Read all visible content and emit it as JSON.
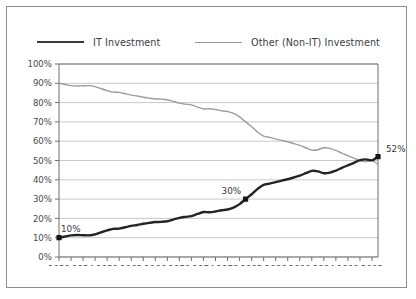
{
  "chart_data": {
    "type": "line",
    "title": "",
    "xlabel": "",
    "ylabel": "",
    "xlim": [
      1950,
      2003
    ],
    "ylim": [
      0,
      100
    ],
    "grid": true,
    "legend_position": "top",
    "y_ticks": [
      "0%",
      "10%",
      "20%",
      "30%",
      "40%",
      "50%",
      "60%",
      "70%",
      "80%",
      "90%",
      "100%"
    ],
    "y_tick_values": [
      0,
      10,
      20,
      30,
      40,
      50,
      60,
      70,
      80,
      90,
      100
    ],
    "x_ticks": [
      "1950",
      "1954",
      "1958",
      "1962",
      "1966",
      "1970",
      "1974",
      "1978",
      "1982",
      "1986",
      "1990",
      "1994",
      "1998",
      "2002"
    ],
    "x_tick_values": [
      1950,
      1954,
      1958,
      1962,
      1966,
      1970,
      1974,
      1978,
      1982,
      1986,
      1990,
      1994,
      1998,
      2002
    ],
    "x": [
      1950,
      1951,
      1952,
      1953,
      1954,
      1955,
      1956,
      1957,
      1958,
      1959,
      1960,
      1961,
      1962,
      1963,
      1964,
      1965,
      1966,
      1967,
      1968,
      1969,
      1970,
      1971,
      1972,
      1973,
      1974,
      1975,
      1976,
      1977,
      1978,
      1979,
      1980,
      1981,
      1982,
      1983,
      1984,
      1985,
      1986,
      1987,
      1988,
      1989,
      1990,
      1991,
      1992,
      1993,
      1994,
      1995,
      1996,
      1997,
      1998,
      1999,
      2000,
      2001,
      2002,
      2003
    ],
    "series": [
      {
        "name": "IT Investment",
        "color": "#242424",
        "values": [
          10,
          10.6,
          11.2,
          11.4,
          11.3,
          11.2,
          11.7,
          12.8,
          13.8,
          14.6,
          14.7,
          15.4,
          16.1,
          16.6,
          17.2,
          17.7,
          18.1,
          18.2,
          18.5,
          19.4,
          20.3,
          20.8,
          21.2,
          22.3,
          23.3,
          23.2,
          23.6,
          24.2,
          24.6,
          25.6,
          27.4,
          30,
          32.5,
          35.3,
          37.4,
          38,
          38.8,
          39.6,
          40.3,
          41.2,
          42.2,
          43.4,
          44.6,
          44.4,
          43.4,
          43.7,
          44.8,
          46.2,
          47.5,
          48.8,
          50.2,
          50.6,
          50.1,
          52
        ]
      },
      {
        "name": "Other (Non-IT) Investment",
        "color": "#9d9d9d",
        "values": [
          90,
          89.4,
          88.8,
          88.6,
          88.7,
          88.8,
          88.3,
          87.2,
          86.2,
          85.4,
          85.3,
          84.6,
          83.9,
          83.4,
          82.8,
          82.3,
          81.9,
          81.8,
          81.5,
          80.6,
          79.7,
          79.2,
          78.8,
          77.7,
          76.7,
          76.8,
          76.4,
          75.8,
          75.4,
          74.4,
          72.6,
          70,
          67.5,
          64.7,
          62.6,
          62,
          61.2,
          60.4,
          59.7,
          58.8,
          57.8,
          56.6,
          55.4,
          55.6,
          56.6,
          56.3,
          55.2,
          53.8,
          52.5,
          51.2,
          49.8,
          49.4,
          49.9,
          48
        ]
      }
    ],
    "annotations": [
      {
        "label": "10%",
        "x": 1950,
        "y": 10,
        "series": "IT Investment",
        "marker": true
      },
      {
        "label": "30%",
        "x": 1981,
        "y": 30,
        "series": "IT Investment",
        "marker": true
      },
      {
        "label": "52%",
        "x": 2003,
        "y": 52,
        "series": "IT Investment",
        "marker": true
      }
    ]
  },
  "legend": {
    "items": [
      {
        "label": "IT Investment",
        "color": "#242424"
      },
      {
        "label": "Other (Non-IT) Investment",
        "color": "#9d9d9d"
      }
    ]
  }
}
